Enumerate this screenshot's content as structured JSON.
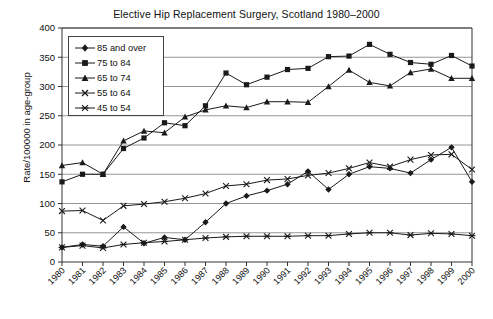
{
  "chart_data": {
    "type": "line",
    "title": "Elective Hip Replacement Surgery, Scotland 1980–2000",
    "xlabel": "",
    "ylabel": "Rate/100000 in age-group",
    "ylim": [
      0,
      400
    ],
    "ytick_step": 50,
    "yticks": [
      "0",
      "50",
      "100",
      "150",
      "200",
      "250",
      "300",
      "350",
      "400"
    ],
    "grid": "horizontal",
    "legend_position": "upper-left-inside",
    "x": [
      "1980",
      "1981",
      "1982",
      "1983",
      "1984",
      "1985",
      "1986",
      "1987",
      "1988",
      "1989",
      "1990",
      "1991",
      "1992",
      "1993",
      "1994",
      "1995",
      "1996",
      "1997",
      "1998",
      "1999",
      "2000"
    ],
    "categories": [
      "1980",
      "1981",
      "1982",
      "1983",
      "1984",
      "1985",
      "1986",
      "1987",
      "1988",
      "1989",
      "1990",
      "1991",
      "1992",
      "1993",
      "1994",
      "1995",
      "1996",
      "1997",
      "1998",
      "1999",
      "2000"
    ],
    "series": [
      {
        "name": "85 and over",
        "marker": "diamond",
        "values": [
          25,
          30,
          27,
          60,
          32,
          42,
          38,
          68,
          100,
          113,
          122,
          133,
          155,
          124,
          150,
          163,
          160,
          152,
          175,
          196,
          137
        ]
      },
      {
        "name": "75 to 84",
        "marker": "square",
        "values": [
          137,
          150,
          150,
          194,
          212,
          238,
          233,
          267,
          323,
          303,
          316,
          329,
          331,
          351,
          352,
          372,
          355,
          341,
          338,
          353,
          335
        ]
      },
      {
        "name": "65 to 74",
        "marker": "triangle",
        "values": [
          165,
          170,
          150,
          207,
          224,
          221,
          248,
          260,
          267,
          264,
          274,
          274,
          273,
          300,
          328,
          307,
          301,
          324,
          330,
          314,
          314
        ]
      },
      {
        "name": "55 to 64",
        "marker": "cross",
        "values": [
          87,
          88,
          71,
          96,
          99,
          103,
          109,
          117,
          130,
          133,
          140,
          142,
          148,
          152,
          160,
          170,
          163,
          175,
          183,
          184,
          158
        ]
      },
      {
        "name": "45 to 54",
        "marker": "asterisk",
        "values": [
          25,
          28,
          24,
          30,
          33,
          35,
          38,
          41,
          43,
          44,
          44,
          44,
          45,
          45,
          48,
          50,
          50,
          46,
          49,
          48,
          45
        ]
      }
    ],
    "colors": {
      "line": "#1a1a1a",
      "grid": "#8a8a8a",
      "axis": "#333333",
      "background": "#ffffff"
    }
  },
  "legend": {
    "items": [
      {
        "label": "85 and over"
      },
      {
        "label": "75 to 84"
      },
      {
        "label": "65 to 74"
      },
      {
        "label": "55 to 64"
      },
      {
        "label": "45 to 54"
      }
    ]
  }
}
